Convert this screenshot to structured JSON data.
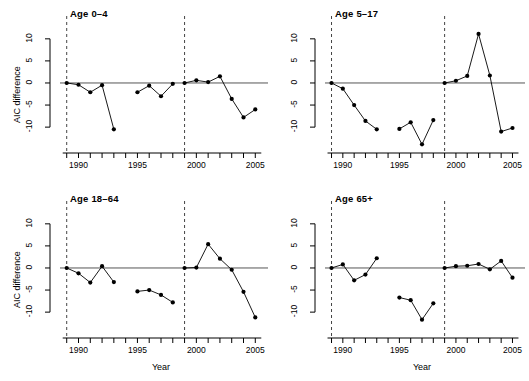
{
  "figure": {
    "type": "multi-panel-line-chart",
    "panel_count": 4,
    "layout": "2x2"
  },
  "axis": {
    "ylabel": "AIC difference",
    "xlabel": "Year",
    "ytick_labels": [
      "-10",
      "-5",
      "0",
      "5",
      "10"
    ],
    "ytick_values": [
      -10,
      -5,
      0,
      5,
      10
    ],
    "xtick_labels": [
      "1990",
      "1995",
      "2000",
      "2005"
    ],
    "xtick_values": [
      1990,
      1995,
      2000,
      2005
    ],
    "xlim": [
      1988.6,
      2005.4
    ],
    "ylim": [
      -14.5,
      12.0
    ],
    "xtick_all": [
      1989,
      1990,
      1991,
      1992,
      1993,
      1994,
      1995,
      1996,
      1997,
      1998,
      1999,
      2000,
      2001,
      2002,
      2003,
      2004,
      2005
    ]
  },
  "colors": {
    "line": "#000000",
    "marker": "#000000",
    "zero_line": "#555555",
    "reference_line": "#444444",
    "axis": "#000000",
    "background": "#ffffff"
  },
  "annotations": {
    "zero_line_value": 0,
    "vertical_reference_years": [
      1989,
      1999
    ],
    "vertical_reference_style": "dashed"
  },
  "chart_data": [
    {
      "type": "line",
      "title": "Age 0–4",
      "xlabel": "",
      "ylabel": "AIC difference",
      "ylim": [
        -14.5,
        12.0
      ],
      "xlim": [
        1988.6,
        2005.4
      ],
      "grid": false,
      "legend": "none",
      "segments": [
        {
          "x": [
            1989,
            1990,
            1991,
            1992,
            1993
          ],
          "y": [
            0.0,
            -0.4,
            -2.1,
            -0.5,
            -10.5
          ]
        },
        {
          "x": [
            1995,
            1996,
            1997,
            1998
          ],
          "y": [
            -2.1,
            -0.6,
            -3.0,
            -0.2
          ]
        },
        {
          "x": [
            1999,
            2000,
            2001,
            2002,
            2003,
            2004,
            2005
          ],
          "y": [
            0.0,
            0.6,
            0.2,
            1.5,
            -3.6,
            -7.8,
            -6.0
          ]
        }
      ]
    },
    {
      "type": "line",
      "title": "Age 5–17",
      "xlabel": "",
      "ylabel": "",
      "ylim": [
        -14.5,
        12.0
      ],
      "xlim": [
        1988.6,
        2005.4
      ],
      "grid": false,
      "legend": "none",
      "segments": [
        {
          "x": [
            1989,
            1990,
            1991,
            1992,
            1993
          ],
          "y": [
            0.0,
            -1.3,
            -5.0,
            -8.6,
            -10.5
          ]
        },
        {
          "x": [
            1995,
            1996,
            1997,
            1998
          ],
          "y": [
            -10.4,
            -8.9,
            -13.9,
            -8.4
          ]
        },
        {
          "x": [
            1999,
            2000,
            2001,
            2002,
            2003,
            2004,
            2005
          ],
          "y": [
            0.0,
            0.5,
            1.6,
            11.1,
            1.7,
            -11.0,
            -10.2
          ]
        }
      ]
    },
    {
      "type": "line",
      "title": "Age 18–64",
      "xlabel": "Year",
      "ylabel": "AIC difference",
      "ylim": [
        -14.5,
        12.0
      ],
      "xlim": [
        1988.6,
        2005.4
      ],
      "grid": false,
      "legend": "none",
      "segments": [
        {
          "x": [
            1989,
            1990,
            1991,
            1992,
            1993
          ],
          "y": [
            0.0,
            -1.2,
            -3.3,
            0.4,
            -3.2
          ]
        },
        {
          "x": [
            1995,
            1996,
            1997,
            1998
          ],
          "y": [
            -5.3,
            -5.0,
            -6.1,
            -7.8
          ]
        },
        {
          "x": [
            1999,
            2000,
            2001,
            2002,
            2003,
            2004,
            2005
          ],
          "y": [
            0.0,
            0.1,
            5.4,
            2.1,
            -0.4,
            -5.4,
            -11.2
          ]
        }
      ]
    },
    {
      "type": "line",
      "title": "Age 65+",
      "xlabel": "Year",
      "ylabel": "",
      "ylim": [
        -14.5,
        12.0
      ],
      "xlim": [
        1988.6,
        2005.4
      ],
      "grid": false,
      "legend": "none",
      "segments": [
        {
          "x": [
            1989,
            1990,
            1991,
            1992,
            1993
          ],
          "y": [
            0.0,
            0.8,
            -2.8,
            -1.5,
            2.2
          ]
        },
        {
          "x": [
            1995,
            1996,
            1997,
            1998
          ],
          "y": [
            -6.7,
            -7.3,
            -11.7,
            -8.0
          ]
        },
        {
          "x": [
            1999,
            2000,
            2001,
            2002,
            2003,
            2004,
            2005
          ],
          "y": [
            0.0,
            0.4,
            0.5,
            0.9,
            -0.3,
            1.6,
            -2.2
          ]
        }
      ]
    }
  ]
}
